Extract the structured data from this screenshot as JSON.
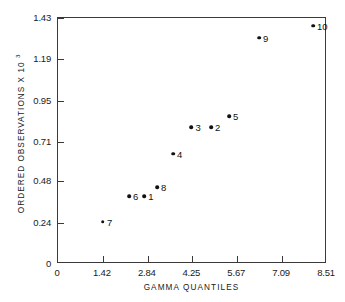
{
  "chart_data": {
    "type": "scatter",
    "title": "",
    "xlabel": "GAMMA QUANTILES",
    "ylabel": "ORDERED OBSERVATIONS X 10",
    "ylabel_exponent": "3",
    "xlim": [
      0,
      8.51
    ],
    "ylim": [
      0,
      1.43
    ],
    "grid": false,
    "legend": "none",
    "xticks": [
      "0",
      "1.42",
      "2.84",
      "4.25",
      "5.67",
      "7.09",
      "8.51"
    ],
    "xtick_values": [
      0,
      1.42,
      2.84,
      4.25,
      5.67,
      7.09,
      8.51
    ],
    "yticks": [
      "0",
      "0.24",
      "0.48",
      "0.71",
      "0.95",
      "1.19",
      "1.43"
    ],
    "ytick_values": [
      0,
      0.24,
      0.48,
      0.71,
      0.95,
      1.19,
      1.43
    ],
    "point_labels": [
      "1",
      "2",
      "3",
      "4",
      "5",
      "6",
      "7",
      "8",
      "9",
      "10"
    ],
    "x": [
      2.73,
      4.84,
      4.22,
      3.64,
      5.41,
      2.25,
      1.42,
      3.13,
      6.36,
      8.07
    ],
    "y": [
      0.395,
      0.795,
      0.795,
      0.64,
      0.86,
      0.395,
      0.245,
      0.445,
      1.315,
      1.385
    ],
    "points": [
      {
        "label": "1",
        "x": 2.73,
        "y": 0.395
      },
      {
        "label": "2",
        "x": 4.84,
        "y": 0.795
      },
      {
        "label": "3",
        "x": 4.22,
        "y": 0.795
      },
      {
        "label": "4",
        "x": 3.64,
        "y": 0.64
      },
      {
        "label": "5",
        "x": 5.41,
        "y": 0.86
      },
      {
        "label": "6",
        "x": 2.25,
        "y": 0.395
      },
      {
        "label": "7",
        "x": 1.42,
        "y": 0.245
      },
      {
        "label": "8",
        "x": 3.13,
        "y": 0.445
      },
      {
        "label": "9",
        "x": 6.36,
        "y": 1.315
      },
      {
        "label": "10",
        "x": 8.07,
        "y": 1.385
      }
    ],
    "colors": {
      "marker": "#111111",
      "axis": "#3a3a3a",
      "background": "#ffffff",
      "text": "#1a1a1a"
    }
  }
}
